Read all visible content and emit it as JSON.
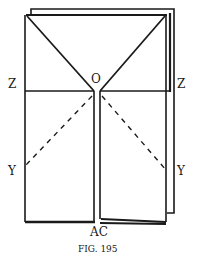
{
  "figure": {
    "caption": "FIG. 195",
    "labels": {
      "center": "O",
      "left_mid": "Z",
      "right_mid": "Z",
      "left_low": "Y",
      "right_low": "Y",
      "bottom": "AC"
    },
    "colors": {
      "ink": "#1a1a1a",
      "paper": "#ffffff"
    }
  }
}
